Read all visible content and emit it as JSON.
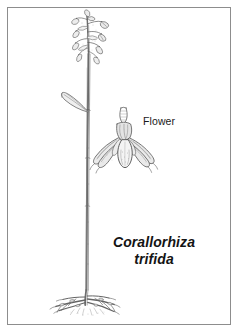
{
  "plate": {
    "background_color": "#ffffff",
    "border_color": "#8d8d8d",
    "ink_color": "#4a4a4a",
    "text_color": "#1a1a1a"
  },
  "labels": {
    "flower_callout": "Flower",
    "species_genus": "Corallorhiza",
    "species_epithet": "trifida"
  },
  "illustration": {
    "subject": "Corallorhiza trifida botanical illustration",
    "whole_plant_name": "whole-plant-drawing",
    "detail_name": "flower-detail-drawing",
    "parts": [
      "inflorescence",
      "stem",
      "stem-bract",
      "coralloid-rhizome",
      "flower-detail"
    ]
  }
}
